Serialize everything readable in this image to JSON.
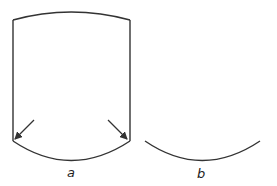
{
  "figure": {
    "panels": [
      {
        "id": "a",
        "label": "a",
        "description": "Closed curved-top container with arrows pointing toward bottom corners"
      },
      {
        "id": "b",
        "label": "b",
        "description": "Single curved arc (bottom curve)"
      }
    ],
    "stroke_color": "#333333"
  }
}
